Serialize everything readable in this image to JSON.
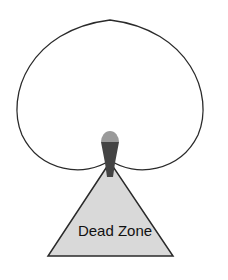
{
  "diagram": {
    "type": "cardioid-pickup-pattern",
    "label": "Dead Zone",
    "colors": {
      "outline": "#2a2a2a",
      "dead_zone_fill": "#d9d9d9",
      "mic_head": "#9a9a9a",
      "mic_body": "#444444"
    }
  }
}
